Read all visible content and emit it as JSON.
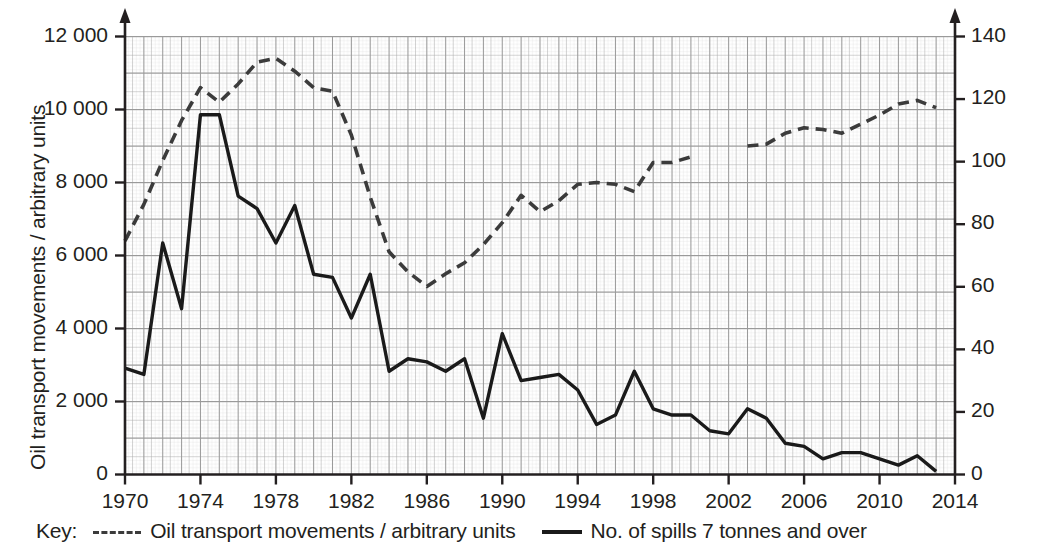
{
  "chart_data": {
    "type": "line",
    "title": "",
    "xlabel": "",
    "ylabel": "Oil transport movements / arbitrary units",
    "y2label": "Spills 7 tonnes and over",
    "xlim": [
      1970,
      2014
    ],
    "ylim": [
      0,
      12000
    ],
    "y2lim": [
      0,
      140
    ],
    "grid": true,
    "legend_position": "bottom",
    "x_ticks": [
      1970,
      1974,
      1978,
      1982,
      1986,
      1990,
      1994,
      1998,
      2002,
      2006,
      2010,
      2014
    ],
    "x_tick_labels": [
      "1970",
      "1974",
      "1978",
      "1982",
      "1986",
      "1990",
      "1994",
      "1998",
      "2002",
      "2006",
      "2010",
      "2014"
    ],
    "y_ticks": [
      0,
      2000,
      4000,
      6000,
      8000,
      10000,
      12000
    ],
    "y_tick_labels": [
      "0",
      "2 000",
      "4 000",
      "6 000",
      "8 000",
      "10 000",
      "12 000"
    ],
    "y2_ticks": [
      0,
      20,
      40,
      60,
      80,
      100,
      120,
      140
    ],
    "y2_tick_labels": [
      "0",
      "20",
      "40",
      "60",
      "80",
      "100",
      "120",
      "140"
    ],
    "series": [
      {
        "name": "Oil transport movements / arbitrary units",
        "style": "dashed",
        "color": "#3b3b3b",
        "axis": "left",
        "x": [
          1970,
          1971,
          1972,
          1973,
          1974,
          1975,
          1976,
          1977,
          1978,
          1979,
          1980,
          1981,
          1982,
          1983,
          1984,
          1985,
          1986,
          1987,
          1988,
          1989,
          1990,
          1991,
          1992,
          1993,
          1994,
          1995,
          1996,
          1997,
          1998,
          1999,
          2000,
          2003,
          2004,
          2005,
          2006,
          2007,
          2008,
          2009,
          2010,
          2011,
          2012,
          2013
        ],
        "values": [
          6400,
          7400,
          8600,
          9700,
          10600,
          10200,
          10700,
          11300,
          11400,
          11050,
          10600,
          10500,
          9300,
          7600,
          6100,
          5550,
          5150,
          5500,
          5800,
          6300,
          6900,
          7650,
          7200,
          7500,
          7950,
          8000,
          7950,
          7750,
          8550,
          8550,
          8700,
          9000,
          9050,
          9350,
          9500,
          9450,
          9350,
          9600,
          9850,
          10150,
          10250,
          10050
        ]
      },
      {
        "name": "No. of spills 7 tonnes and over",
        "style": "solid",
        "color": "#1a1a1a",
        "axis": "right",
        "x": [
          1970,
          1971,
          1972,
          1973,
          1974,
          1975,
          1976,
          1977,
          1978,
          1979,
          1980,
          1981,
          1982,
          1983,
          1984,
          1985,
          1986,
          1987,
          1988,
          1989,
          1990,
          1991,
          1992,
          1993,
          1994,
          1995,
          1996,
          1997,
          1998,
          1999,
          2000,
          2001,
          2002,
          2003,
          2004,
          2005,
          2006,
          2007,
          2008,
          2009,
          2010,
          2011,
          2012,
          2013
        ],
        "values": [
          34,
          32,
          74,
          53,
          115,
          115,
          89,
          85,
          74,
          86,
          64,
          63,
          50,
          64,
          33,
          37,
          36,
          33,
          37,
          18,
          45,
          30,
          31,
          32,
          27,
          16,
          19,
          33,
          21,
          19,
          19,
          14,
          13,
          21,
          18,
          10,
          9,
          5,
          7,
          7,
          5,
          3,
          6,
          1
        ]
      }
    ]
  },
  "legend": {
    "key_word": "Key:",
    "entries": [
      {
        "label": "Oil transport movements / arbitrary units",
        "style": "dashed"
      },
      {
        "label": "No. of spills 7 tonnes and over",
        "style": "solid"
      }
    ]
  }
}
